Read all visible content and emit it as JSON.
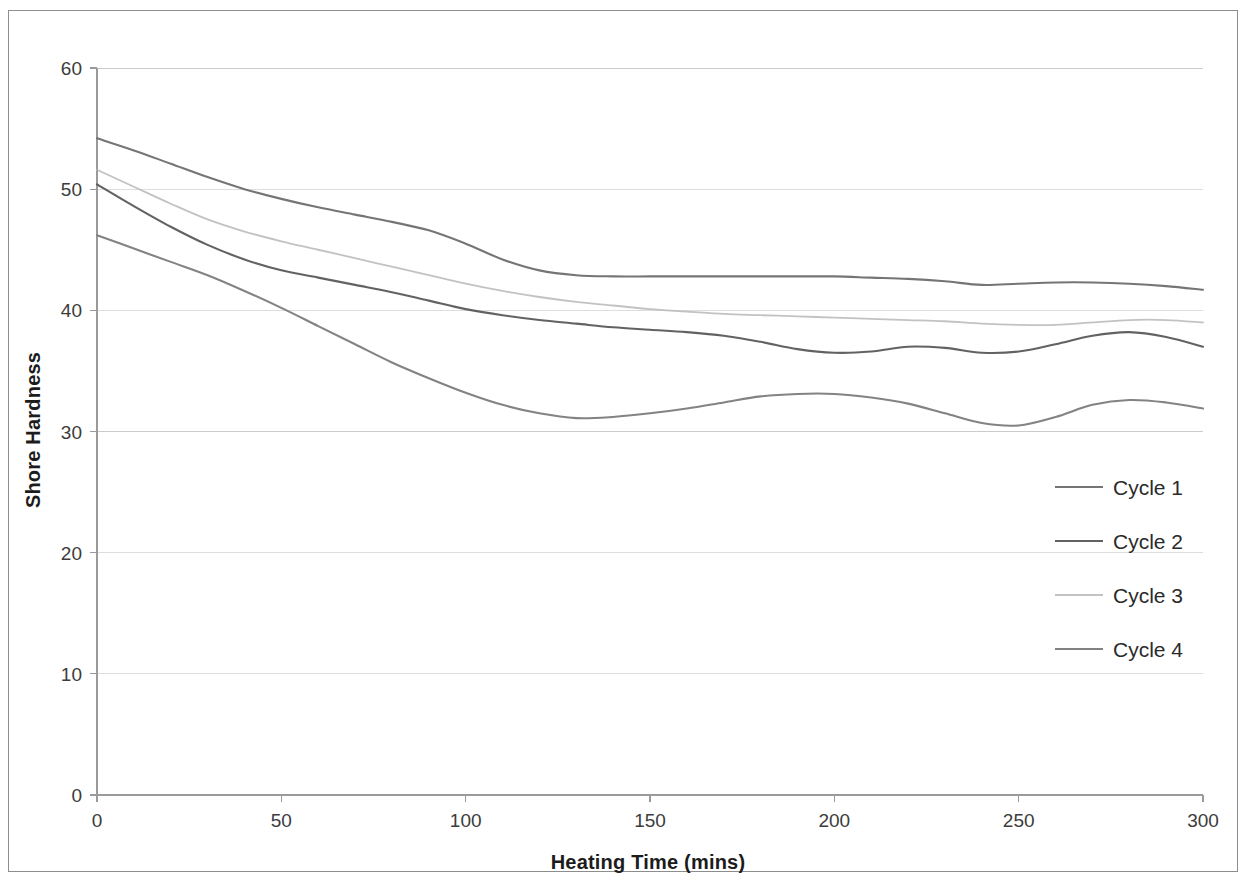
{
  "figure": {
    "background_color": "#ffffff",
    "border_color": "#8d8d8d"
  },
  "chart_data": {
    "type": "line",
    "title": "",
    "xlabel": "Heating Time (mins)",
    "ylabel": "Shore Hardness",
    "xlim": [
      0,
      300
    ],
    "ylim": [
      0,
      60
    ],
    "xticks": [
      0,
      50,
      100,
      150,
      200,
      250,
      300
    ],
    "xtick_labels": [
      "0",
      "50",
      "100",
      "150",
      "200",
      "250",
      "300"
    ],
    "yticks": [
      0,
      10,
      20,
      30,
      40,
      50,
      60
    ],
    "ytick_labels": [
      "0",
      "10",
      "20",
      "30",
      "40",
      "50",
      "60"
    ],
    "grid": true,
    "grid_axis": "y",
    "grid_color": "#c9c9c9",
    "legend_position": "center-right",
    "x": [
      0,
      10,
      20,
      30,
      40,
      50,
      60,
      70,
      80,
      90,
      100,
      110,
      120,
      130,
      140,
      150,
      160,
      170,
      180,
      190,
      200,
      210,
      220,
      230,
      240,
      250,
      260,
      270,
      280,
      290,
      300
    ],
    "series": [
      {
        "name": "Cycle 1",
        "color": "#6e6e6e",
        "values": [
          54.2,
          53.2,
          52.1,
          51.0,
          50.0,
          49.2,
          48.5,
          47.9,
          47.3,
          46.6,
          45.5,
          44.2,
          43.3,
          42.9,
          42.8,
          42.8,
          42.8,
          42.8,
          42.8,
          42.8,
          42.8,
          42.7,
          42.6,
          42.4,
          42.1,
          42.2,
          42.3,
          42.3,
          42.2,
          42.0,
          41.7
        ]
      },
      {
        "name": "Cycle 2",
        "color": "#5a5a5a",
        "values": [
          50.4,
          48.6,
          46.9,
          45.4,
          44.2,
          43.3,
          42.7,
          42.1,
          41.5,
          40.8,
          40.1,
          39.6,
          39.2,
          38.9,
          38.6,
          38.4,
          38.2,
          37.9,
          37.4,
          36.8,
          36.5,
          36.6,
          37.0,
          36.9,
          36.5,
          36.6,
          37.2,
          37.9,
          38.2,
          37.8,
          37.0
        ]
      },
      {
        "name": "Cycle 3",
        "color": "#b4b4b4",
        "values": [
          51.6,
          50.2,
          48.8,
          47.5,
          46.5,
          45.7,
          45.0,
          44.3,
          43.6,
          42.9,
          42.2,
          41.6,
          41.1,
          40.7,
          40.4,
          40.1,
          39.9,
          39.7,
          39.6,
          39.5,
          39.4,
          39.3,
          39.2,
          39.1,
          38.9,
          38.8,
          38.8,
          39.0,
          39.2,
          39.2,
          39.0
        ]
      },
      {
        "name": "Cycle 4",
        "color": "#7c7c7c",
        "values": [
          46.2,
          45.1,
          44.0,
          42.9,
          41.6,
          40.2,
          38.7,
          37.2,
          35.7,
          34.4,
          33.2,
          32.2,
          31.5,
          31.1,
          31.2,
          31.5,
          31.9,
          32.4,
          32.9,
          33.1,
          33.1,
          32.8,
          32.3,
          31.5,
          30.7,
          30.5,
          31.2,
          32.2,
          32.6,
          32.4,
          31.9
        ]
      }
    ]
  },
  "legend": {
    "items": [
      {
        "label": "Cycle 1"
      },
      {
        "label": "Cycle 2"
      },
      {
        "label": "Cycle 3"
      },
      {
        "label": "Cycle 4"
      }
    ]
  }
}
